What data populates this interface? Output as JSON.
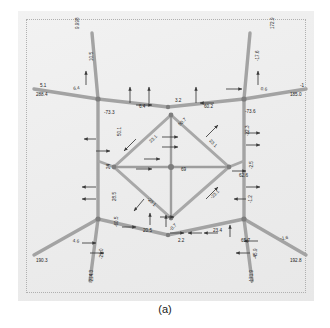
{
  "page": {
    "cut_text_above": "1 11 11 1 1111111 111111111 11 1111",
    "caption": "(a)"
  },
  "figure": {
    "background_color": "#efefef",
    "member_color": "#9a9a9a",
    "border_style": "dotted",
    "border_color": "#b0b0b0"
  },
  "chart_data": {
    "type": "diagram",
    "title": "(a)",
    "xlabel": "",
    "ylabel": "",
    "grid": false,
    "legend": null,
    "annotations": [
      {
        "id": "a01",
        "value": "9.998",
        "x": 58,
        "y": 18,
        "rot": -90
      },
      {
        "id": "a02",
        "value": "172.9",
        "x": 253,
        "y": 18,
        "rot": -90
      },
      {
        "id": "a03",
        "value": "10.5",
        "x": 72,
        "y": 50,
        "rot": -90
      },
      {
        "id": "a04",
        "value": "-17.6",
        "x": 238,
        "y": 50,
        "rot": -90
      },
      {
        "id": "a05",
        "value": "5.1",
        "x": 22,
        "y": 73,
        "rot": 0
      },
      {
        "id": "a06",
        "value": "-1",
        "x": 282,
        "y": 73,
        "rot": 0
      },
      {
        "id": "a07",
        "value": "288.4",
        "x": 18,
        "y": 82,
        "rot": 0
      },
      {
        "id": "a08",
        "value": "185.0",
        "x": 272,
        "y": 82,
        "rot": 0
      },
      {
        "id": "a09",
        "value": "6.4",
        "x": 55,
        "y": 76,
        "rot": -8
      },
      {
        "id": "a10",
        "value": "0.6",
        "x": 243,
        "y": 76,
        "rot": 8
      },
      {
        "id": "a11",
        "value": "3.2",
        "x": 157,
        "y": 88,
        "rot": 0
      },
      {
        "id": "a12",
        "value": "6.4",
        "x": 121,
        "y": 94,
        "rot": 0
      },
      {
        "id": "a13",
        "value": "60.2",
        "x": 186,
        "y": 94,
        "rot": 0
      },
      {
        "id": "a14",
        "value": "-73.3",
        "x": 86,
        "y": 100,
        "rot": 0
      },
      {
        "id": "a15",
        "value": "-73.6",
        "x": 227,
        "y": 99,
        "rot": 0
      },
      {
        "id": "a16",
        "value": "50.7",
        "x": 160,
        "y": 113,
        "rot": -45
      },
      {
        "id": "a17",
        "value": "23.1",
        "x": 131,
        "y": 130,
        "rot": -45
      },
      {
        "id": "a18",
        "value": "23.1",
        "x": 193,
        "y": 128,
        "rot": 45
      },
      {
        "id": "a19",
        "value": "50.1",
        "x": 100,
        "y": 125,
        "rot": -90
      },
      {
        "id": "a20",
        "value": "-22.3",
        "x": 228,
        "y": 125,
        "rot": -90
      },
      {
        "id": "a21",
        "value": "24",
        "x": 89,
        "y": 158,
        "rot": -90
      },
      {
        "id": "a22",
        "value": "-2.5",
        "x": 232,
        "y": 158,
        "rot": -90
      },
      {
        "id": "a23",
        "value": "69",
        "x": 163,
        "y": 157,
        "rot": 0
      },
      {
        "id": "a24",
        "value": "62.6",
        "x": 221,
        "y": 163,
        "rot": 0
      },
      {
        "id": "a25",
        "value": "-23.1",
        "x": 131,
        "y": 186,
        "rot": 45
      },
      {
        "id": "a26",
        "value": "-23.1",
        "x": 192,
        "y": 186,
        "rot": -45
      },
      {
        "id": "a27",
        "value": "-1.2",
        "x": 231,
        "y": 192,
        "rot": -90
      },
      {
        "id": "a28",
        "value": "28.5",
        "x": 95,
        "y": 190,
        "rot": -90
      },
      {
        "id": "a29",
        "value": "-60.5",
        "x": 97,
        "y": 216,
        "rot": -90
      },
      {
        "id": "a30",
        "value": "20.5",
        "x": 125,
        "y": 218,
        "rot": 0
      },
      {
        "id": "a31",
        "value": "-0.7",
        "x": 151,
        "y": 218,
        "rot": -45
      },
      {
        "id": "a32",
        "value": "2.2",
        "x": 160,
        "y": 228,
        "rot": 0
      },
      {
        "id": "a33",
        "value": "23.4",
        "x": 195,
        "y": 218,
        "rot": 0
      },
      {
        "id": "a34",
        "value": "65.7",
        "x": 223,
        "y": 228,
        "rot": 0
      },
      {
        "id": "a35",
        "value": "4.6",
        "x": 55,
        "y": 228,
        "rot": 8
      },
      {
        "id": "a36",
        "value": "-1.6",
        "x": 262,
        "y": 226,
        "rot": -8
      },
      {
        "id": "a37",
        "value": "190.3",
        "x": 18,
        "y": 248,
        "rot": 0
      },
      {
        "id": "a38",
        "value": "192.8",
        "x": 272,
        "y": 248,
        "rot": 0
      },
      {
        "id": "a39",
        "value": "-21.0",
        "x": 82,
        "y": 248,
        "rot": -90
      },
      {
        "id": "a40",
        "value": "-45.9",
        "x": 236,
        "y": 248,
        "rot": -90
      },
      {
        "id": "a41",
        "value": "-214.3",
        "x": 72,
        "y": 272,
        "rot": -90
      },
      {
        "id": "a42",
        "value": "-171.9",
        "x": 232,
        "y": 272,
        "rot": -90
      }
    ]
  }
}
